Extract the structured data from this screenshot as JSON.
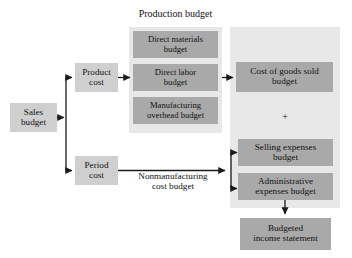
{
  "diagram": {
    "colors": {
      "box_fill": "#a9a9a9",
      "light_box_fill": "#cfcfcf",
      "panel_fill": "#e8e8e8",
      "line": "#1a1a1a",
      "text": "#111111",
      "background": "#ffffff"
    },
    "labels": {
      "production_budget": "Production budget",
      "nonmanufacturing_cost_budget": "Nonmanufacturing\ncost budget",
      "plus": "+"
    },
    "nodes": {
      "sales_budget": "Sales\nbudget",
      "product_cost": "Product\ncost",
      "period_cost": "Period\ncost",
      "direct_materials_budget": "Direct materials\nbudget",
      "direct_labor_budget": "Direct labor\nbudget",
      "manufacturing_overhead_budget": "Manufacturing\noverhead budget",
      "cost_of_goods_sold_budget": "Cost of goods sold\nbudget",
      "selling_expenses_budget": "Selling expenses\nbudget",
      "administrative_expenses_budget": "Administrative\nexpenses budget",
      "budgeted_income_statement": "Budgeted\nincome statement"
    }
  }
}
